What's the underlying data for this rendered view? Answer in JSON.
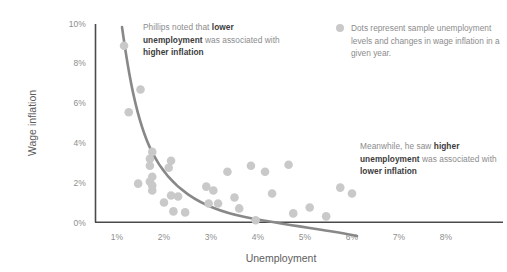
{
  "chart_data": {
    "type": "scatter",
    "title": "",
    "xlabel": "Unemployment",
    "ylabel": "Wage inflation",
    "xlim": [
      0,
      8.6
    ],
    "ylim": [
      0,
      10
    ],
    "xticks": [
      "1%",
      "2%",
      "3%",
      "4%",
      "5%",
      "6%",
      "7%",
      "8%"
    ],
    "xtick_values": [
      1,
      2,
      3,
      4,
      5,
      6,
      7,
      8
    ],
    "yticks": [
      "0%",
      "2%",
      "4%",
      "6%",
      "8%",
      "10%"
    ],
    "ytick_values": [
      0,
      2,
      4,
      6,
      8,
      10
    ],
    "grid": false,
    "legend_position": "top-right",
    "series": [
      {
        "name": "Sample years",
        "type": "scatter",
        "color": "#c9c9c9",
        "points": [
          [
            1.15,
            8.9
          ],
          [
            1.5,
            6.7
          ],
          [
            1.25,
            5.55
          ],
          [
            1.75,
            3.55
          ],
          [
            1.7,
            3.2
          ],
          [
            1.7,
            2.85
          ],
          [
            2.15,
            3.1
          ],
          [
            2.1,
            2.75
          ],
          [
            1.75,
            2.3
          ],
          [
            1.7,
            2.05
          ],
          [
            1.45,
            1.95
          ],
          [
            2.15,
            1.35
          ],
          [
            2.3,
            1.3
          ],
          [
            1.75,
            1.85
          ],
          [
            1.75,
            1.6
          ],
          [
            2.0,
            1.0
          ],
          [
            2.2,
            0.55
          ],
          [
            2.45,
            0.5
          ],
          [
            2.9,
            1.8
          ],
          [
            3.05,
            1.6
          ],
          [
            3.35,
            2.55
          ],
          [
            3.15,
            0.95
          ],
          [
            3.5,
            1.25
          ],
          [
            3.6,
            0.7
          ],
          [
            3.85,
            2.85
          ],
          [
            3.95,
            0.1
          ],
          [
            4.15,
            2.55
          ],
          [
            4.3,
            1.45
          ],
          [
            4.65,
            2.9
          ],
          [
            4.75,
            0.45
          ],
          [
            5.1,
            0.75
          ],
          [
            5.45,
            0.3
          ],
          [
            5.75,
            1.75
          ],
          [
            6.0,
            1.45
          ],
          [
            2.95,
            0.95
          ]
        ]
      },
      {
        "name": "Phillips curve",
        "type": "line",
        "color": "#888888",
        "description": "Downward-sloping convex curve from high wage inflation at low unemployment to near zero at high unemployment"
      }
    ],
    "annotations": [
      {
        "id": "annotation-left",
        "segments": [
          {
            "text": "Phillips noted that ",
            "bold": false
          },
          {
            "text": "lower unemployment",
            "bold": true
          },
          {
            "text": " was associated with ",
            "bold": false
          },
          {
            "text": "higher inflation",
            "bold": true
          }
        ]
      },
      {
        "id": "annotation-right",
        "segments": [
          {
            "text": "Meanwhile, he saw ",
            "bold": false
          },
          {
            "text": "higher unemployment",
            "bold": true
          },
          {
            "text": " was associated with ",
            "bold": false
          },
          {
            "text": "lower inflation",
            "bold": true
          }
        ]
      }
    ],
    "legend": {
      "marker": "dot",
      "text": "Dots represent sample unemployment levels and changes in wage inflation in a given year."
    },
    "colors": {
      "dot": "#c9c9c9",
      "curve": "#888888",
      "axis": "#4a4a4a",
      "text": "#8c8c8c",
      "emphasis": "#3c3c3c",
      "background": "#ffffff"
    }
  }
}
